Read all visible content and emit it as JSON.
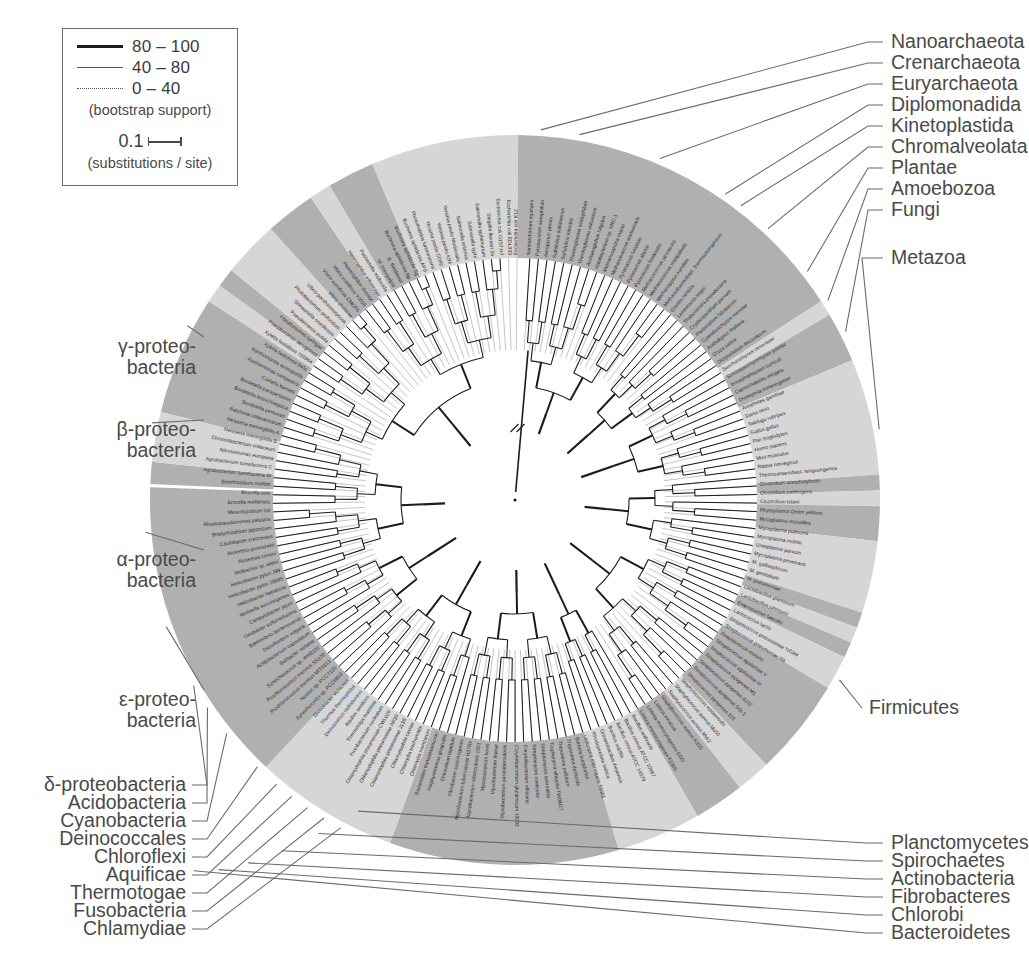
{
  "figure": {
    "type": "phylogenetic-tree-circular",
    "center": [
      515,
      500
    ],
    "colors": {
      "band_dark": "#b0b0b0",
      "band_light": "#d6d6d6",
      "band_mid": "#c4c4c4",
      "tree_line": "#1c1c1c",
      "text": "#3a3a3a",
      "leader": "#6b6b6b",
      "background": "#ffffff"
    }
  },
  "legend": {
    "bootstrap_rows": [
      {
        "style": "solid-thick",
        "label": "80 – 100"
      },
      {
        "style": "solid-thin",
        "label": "40 – 80"
      },
      {
        "style": "dotted",
        "label": "0 – 40"
      }
    ],
    "bootstrap_caption": "(bootstrap support)",
    "scale_value": "0.1",
    "scale_caption": "(substitutions / site)"
  },
  "group_labels": {
    "right_top": [
      {
        "label": "Nanoarchaeota",
        "y": 42
      },
      {
        "label": "Crenarchaeota",
        "y": 63
      },
      {
        "label": "Euryarchaeota",
        "y": 84
      },
      {
        "label": "Diplomonadida",
        "y": 105
      },
      {
        "label": "Kinetoplastida",
        "y": 126
      },
      {
        "label": "Chromalveolata",
        "y": 147
      },
      {
        "label": "Plantae",
        "y": 168
      },
      {
        "label": "Amoebozoa",
        "y": 189
      },
      {
        "label": "Fungi",
        "y": 210
      }
    ],
    "right_mid": [
      {
        "label": "Metazoa",
        "y": 258
      },
      {
        "label": "Firmicutes",
        "y": 708
      }
    ],
    "right_bottom": [
      {
        "label": "Planctomycetes",
        "y": 843
      },
      {
        "label": "Spirochaetes",
        "y": 861
      },
      {
        "label": "Actinobacteria",
        "y": 879
      },
      {
        "label": "Fibrobacteres",
        "y": 897
      },
      {
        "label": "Chlorobi",
        "y": 915
      },
      {
        "label": "Bacteroidetes",
        "y": 933
      }
    ],
    "left_mid": [
      {
        "label": "γ-proteo-\nbacteria",
        "y": 347
      },
      {
        "label": "β-proteo-\nbacteria",
        "y": 430
      },
      {
        "label": "α-proteo-\nbacteria",
        "y": 560
      },
      {
        "label": "ε-proteo-\nbacteria",
        "y": 700
      }
    ],
    "left_bottom": [
      {
        "label": "δ-proteobacteria",
        "y": 785
      },
      {
        "label": "Acidobacteria",
        "y": 803
      },
      {
        "label": "Cyanobacteria",
        "y": 821
      },
      {
        "label": "Deinococcales",
        "y": 839
      },
      {
        "label": "Chloroflexi",
        "y": 857
      },
      {
        "label": "Aquificae",
        "y": 875
      },
      {
        "label": "Thermotogae",
        "y": 893
      },
      {
        "label": "Fusobacteria",
        "y": 911
      },
      {
        "label": "Chlamydiae",
        "y": 929
      }
    ]
  },
  "taxa": [
    "Nanoarchaeum equitans",
    "Pyrobaculum aerophilum",
    "Aeropyrum pernix",
    "Sulfolobus solfataricus",
    "Sulfolobus tokodaii",
    "Thermoplasma acidophilum",
    "Thermoplasma volcanium",
    "Archaeoglobus fulgidus",
    "Halobacterium sp. NRC-1",
    "Methanosarcina mazei",
    "Methanosarcina acetivorans",
    "Pyrococcus furiosus",
    "Pyrococcus abyssi",
    "Pyrococcus horikoshii",
    "Methanococcus jannaschii",
    "Methanococcus maripaludis",
    "Methanopyrus kandleri",
    "Methanothermobact. thermautotrophicus",
    "Giardia lamblia",
    "Leishmania major",
    "Thalassiosira pseudonana",
    "Cryptosporidium parvum",
    "Plasmodium falciparum",
    "Cyanidioschyzon merolae",
    "Arabidopsis thaliana",
    "Oryza sativa",
    "Dictyostelium discoideum",
    "Saccharomyces cerevisiae",
    "Schizosaccharomyces pombe",
    "Encephalitozoon cuniculi",
    "Caenorhabditis elegans",
    "Drosophila melanogaster",
    "Anopheles gambiae",
    "Danio rerio",
    "Takifugu rubripes",
    "Gallus gallus",
    "Pan troglodytes",
    "Homo sapiens",
    "Mus musculus",
    "Rattus norvegicus",
    "Thermoanaerobact. tengcongensis",
    "Clostridium acetobutylicum",
    "Clostridium perfringens",
    "Clostridium tetani",
    "Phytoplasma Onion yellows",
    "Mycoplasma mycoides",
    "Mycoplasma pulmonis",
    "Mycoplasma mobile",
    "Ureaplasma parvum",
    "Mycoplasma penetrans",
    "M. gallisepticum",
    "M. genitalium",
    "M. pneumoniae",
    "Lactobacillus plantarum",
    "Lactobacillus johnsonii",
    "Enterococcus faecalis",
    "Lactococcus lactis",
    "Streptococcus pneumoniae TIGR4",
    "Streptococcus pneumoniae R6",
    "Streptococcus mutans",
    "Streptococcus agalactiae V",
    "Streptococcus agalactiae III",
    "Streptococcus pyogenes M1",
    "Streptococcus pyogenes 8232",
    "Streptococcus pyogenes SSI-1",
    "Streptococcus pyogenes 315",
    "Staphylococcus epidermidis",
    "Staphylococcus aureus Mu50",
    "Staphylococcus aureus MW2",
    "Staphylococcus aureus N315",
    "Listeria innocua",
    "Listeria monocytogenes EGD",
    "Listeria monocytogenes F2365",
    "Bacillus anthracis",
    "Bacillus cereus ATCC 10987",
    "Bacillus cereus ATCC 14579",
    "Bacillus subtilis",
    "Oceanobacillus iheyensis",
    "Rhodopirellula baltica",
    "Leptospira interrogans 56601",
    "Borrelia burgdorferi",
    "Treponema denticola",
    "Treponema pallidum",
    "Tropheryma whipplei TW08/27",
    "Streptomyces avermitilis",
    "Streptomyces coelicolor",
    "Corynebacterium efficiens",
    "Corynebacterium glutamicum 13032",
    "Mycobacterium paratuberculosis",
    "Mycobacterium leprae",
    "Mycobacterium bovis",
    "Mycobacterium tuberculosis 1551",
    "Mycobacterium tuberculosis H37Rv",
    "Fibrobacter succinogenes",
    "Chlorobium tepidum",
    "Porphyromonas gingivalis",
    "Bacteroides thetaiotaomicron",
    "Chlamydia muridarum",
    "Chlamydia trachomatis",
    "Chlamydophila caviae",
    "Chlamydophila pneumoniae J138",
    "Chlamydophila pneumoniae AR39",
    "Chlamydophila pneumoniae CWL029",
    "Fusobacterium nucleatum",
    "Thermotoga maritima",
    "Aquifex aeolicus",
    "Deinococcus radiodurans",
    "Thermus thermophilus",
    "Gloeobacter violaceus",
    "Synechocystis sp. PCC6803",
    "Nostoc sp. PCC7120",
    "Prochlorococcus marinus MIT9313",
    "Prochlorococcus marinus SS120",
    "Synechococcus sp. WH8102",
    "Solibacter usitatus",
    "Acidobacterium capsulatum",
    "Desulfovibrio vulgaris",
    "Bdellovibrio bacteriovorus",
    "Geobacter sulfurreducens",
    "Campylobacter jejuni",
    "Wolinella succinogenes",
    "Helicobacter hepaticus",
    "Helicobacter pylori 26695",
    "Helicobacter pylori J99",
    "Wolbachia sp. wMel",
    "Rickettsia conorii",
    "Rickettsia prowazekii",
    "Caulobacter crescentus",
    "Bradyrhizobium japonicum",
    "Rhodopseudomonas palustris",
    "Mesorhizobium loti",
    "Brucella melitensis",
    "Brucella suis",
    "Sinorhizobium meliloti",
    "Agrobacterium tumefaciens W",
    "Agrobacterium tumefaciens C",
    "Nitrosomonas europaea",
    "Chromobacterium violaceum",
    "Neisseria meningitidis B",
    "Neisseria meningitidis A",
    "Ralstonia solanacearum",
    "Bordetella pertussis",
    "Bordetella bronchiseptica",
    "Bordetella parapertussis",
    "Coxiella burnetii",
    "Xanthomonas campestris",
    "Xanthomonas axonopodis",
    "Xylella fastidiosa 9a5c",
    "Xylella fastidiosa 700964",
    "Pseudomonas aeruginosa",
    "Pseudomonas syringae",
    "Pseudomonas putida",
    "Shewanella oneidensis",
    "Photobacterium profundum",
    "Vibrio parahaemolyticus",
    "Vibrio cholerae",
    "Vibrio vulnificus CMCP6",
    "Vibrio vulnificus YJ016",
    "Haemophilus ducreyi",
    "Haemophilus influenzae",
    "Pasteurella multocida",
    "W. brevipalpis",
    "B. floridanus",
    "Buchnera aphidicola Bp",
    "Buchnera aphidicola Sg",
    "Buchnera aphidicola APS",
    "Photorhabdus luminescens",
    "Yersinia pestis CO92",
    "Yersinia pestis KIM",
    "Yersinia pestis Medievalis",
    "Salmonella enterica",
    "Salmonella typhi",
    "Salmonella typhimurium",
    "Shigella flexneri 2a",
    "Escherichia coli O157:H7",
    "Escherichia coli EDL933",
    "Escherichia coli K12"
  ],
  "bands": [
    {
      "name": "Nanoarchaeota",
      "start": 272.5,
      "end": 276.0,
      "tone": "dark"
    },
    {
      "name": "Crenarchaeota",
      "start": 276.0,
      "end": 284.0,
      "tone": "light"
    },
    {
      "name": "Euryarchaeota",
      "start": 284.0,
      "end": 303.0,
      "tone": "dark"
    },
    {
      "name": "Diplomonadida",
      "start": 303.0,
      "end": 306.0,
      "tone": "light"
    },
    {
      "name": "Kinetoplastida",
      "start": 306.0,
      "end": 309.0,
      "tone": "dark"
    },
    {
      "name": "Chromalveolata",
      "start": 309.0,
      "end": 318.0,
      "tone": "light"
    },
    {
      "name": "Plantae",
      "start": 318.0,
      "end": 326.0,
      "tone": "dark"
    },
    {
      "name": "Amoebozoa",
      "start": 326.0,
      "end": 329.5,
      "tone": "light"
    },
    {
      "name": "Fungi",
      "start": 329.5,
      "end": 337.0,
      "tone": "dark"
    },
    {
      "name": "Metazoa",
      "start": 337.0,
      "end": 360.5,
      "tone": "light"
    },
    {
      "name": "Firmicutes",
      "start": 360.5,
      "end": 417.0,
      "tone": "dark"
    },
    {
      "name": "Planctomycetes",
      "start": 417.0,
      "end": 419.5,
      "tone": "light"
    },
    {
      "name": "Spirochaetes",
      "start": 419.5,
      "end": 427.5,
      "tone": "dark"
    },
    {
      "name": "Actinobacteria",
      "start": 427.5,
      "end": 446.0,
      "tone": "light"
    },
    {
      "name": "Fibrobacteres",
      "start": 446.0,
      "end": 448.5,
      "tone": "dark"
    },
    {
      "name": "Chlorobi",
      "start": 448.5,
      "end": 451.0,
      "tone": "light"
    },
    {
      "name": "Bacteroidetes",
      "start": 451.0,
      "end": 456.5,
      "tone": "dark"
    },
    {
      "name": "Chlamydiae",
      "start": 456.5,
      "end": 468.0,
      "tone": "light"
    },
    {
      "name": "Fusobacteria",
      "start": 468.0,
      "end": 470.5,
      "tone": "dark"
    },
    {
      "name": "Thermotogae",
      "start": 470.5,
      "end": 473.0,
      "tone": "light"
    },
    {
      "name": "Aquificae",
      "start": 473.0,
      "end": 475.5,
      "tone": "dark"
    },
    {
      "name": "Deinococcales",
      "start": 475.5,
      "end": 481.0,
      "tone": "light"
    },
    {
      "name": "Cyanobacteria",
      "start": 481.0,
      "end": 496.5,
      "tone": "dark"
    },
    {
      "name": "Acidobacteria",
      "start": 496.5,
      "end": 502.0,
      "tone": "light"
    },
    {
      "name": "delta-proteobacteria",
      "start": 502.0,
      "end": 510.0,
      "tone": "dark"
    },
    {
      "name": "epsilon-proteobacteria",
      "start": 510.0,
      "end": 523.5,
      "tone": "light"
    },
    {
      "name": "alpha-proteobacteria",
      "start": 523.5,
      "end": 560.0,
      "tone": "dark"
    },
    {
      "name": "beta-proteobacteria",
      "start": 560.0,
      "end": 583.0,
      "tone": "light"
    },
    {
      "name": "gamma-proteobacteria",
      "start": 583.0,
      "end": 632.0,
      "tone": "dark"
    }
  ],
  "chart_data": {
    "type": "tree",
    "layout": "circular",
    "n_taxa": 175,
    "angular_span_deg": 359.5,
    "gap_deg": 0.5,
    "radius_inner": 70,
    "radius_leaf": 300,
    "radius_band_outer": 365,
    "scale_bar_units": 0.1,
    "bootstrap_bins": [
      {
        "range": "80–100",
        "render": "thick solid"
      },
      {
        "range": "40–80",
        "render": "thin solid"
      },
      {
        "range": "0–40",
        "render": "dotted"
      }
    ]
  }
}
